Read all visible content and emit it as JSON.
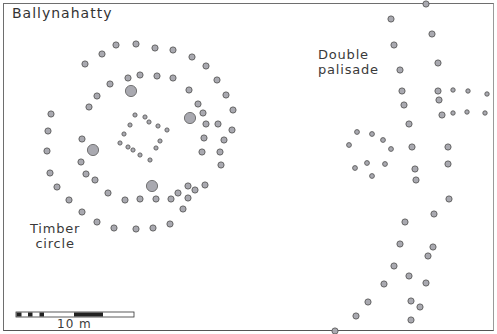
{
  "figure": {
    "title": "Ballynahatty",
    "labels": {
      "timber_circle": [
        "Timber",
        "circle"
      ],
      "double_palisade": [
        "Double",
        "palisade"
      ]
    },
    "scale_bar": {
      "label": "10 m",
      "segments_black": 5
    },
    "colors": {
      "post_fill": "#a9a9b0",
      "post_stroke": "#5a5a5a",
      "frame": "#6e6e6e",
      "text": "#3a3a3a"
    },
    "features": {
      "timber_circle_outer_ring": [
        [
          116,
          45
        ],
        [
          136,
          44
        ],
        [
          155,
          48
        ],
        [
          173,
          50
        ],
        [
          192,
          57
        ],
        [
          206,
          66
        ],
        [
          217,
          80
        ],
        [
          226,
          95
        ],
        [
          233,
          110
        ],
        [
          232,
          130
        ],
        [
          224,
          140
        ],
        [
          220,
          152
        ],
        [
          221,
          165
        ],
        [
          205,
          185
        ],
        [
          195,
          190
        ],
        [
          188,
          198
        ],
        [
          183,
          209
        ],
        [
          170,
          224
        ],
        [
          153,
          228
        ],
        [
          136,
          229
        ],
        [
          114,
          228
        ],
        [
          97,
          222
        ],
        [
          82,
          212
        ],
        [
          69,
          200
        ],
        [
          57,
          187
        ],
        [
          50,
          173
        ],
        [
          47,
          151
        ],
        [
          48,
          131
        ],
        [
          51,
          114
        ],
        [
          85,
          64
        ],
        [
          102,
          54
        ]
      ],
      "timber_circle_middle_ring": [
        [
          110,
          84
        ],
        [
          128,
          78
        ],
        [
          140,
          75
        ],
        [
          157,
          76
        ],
        [
          173,
          78
        ],
        [
          189,
          90
        ],
        [
          198,
          104
        ],
        [
          203,
          113
        ],
        [
          206,
          124
        ],
        [
          218,
          124
        ],
        [
          204,
          138
        ],
        [
          202,
          152
        ],
        [
          188,
          186
        ],
        [
          178,
          193
        ],
        [
          171,
          199
        ],
        [
          156,
          199
        ],
        [
          140,
          199
        ],
        [
          125,
          200
        ],
        [
          108,
          193
        ],
        [
          95,
          180
        ],
        [
          86,
          174
        ],
        [
          81,
          162
        ],
        [
          82,
          139
        ],
        [
          89,
          107
        ],
        [
          97,
          96
        ]
      ],
      "timber_circle_large_posts": [
        [
          131,
          91
        ],
        [
          190,
          118
        ],
        [
          93,
          150
        ],
        [
          152,
          186
        ]
      ],
      "timber_circle_inner_square": [
        [
          135,
          115
        ],
        [
          145,
          117
        ],
        [
          149,
          122
        ],
        [
          158,
          126
        ],
        [
          167,
          130
        ],
        [
          130,
          125
        ],
        [
          124,
          134
        ],
        [
          120,
          143
        ],
        [
          128,
          147
        ],
        [
          133,
          150
        ],
        [
          140,
          155
        ],
        [
          150,
          160
        ],
        [
          160,
          141
        ],
        [
          156,
          148
        ]
      ],
      "palisade_outer": [
        [
          426,
          4
        ],
        [
          391,
          19
        ],
        [
          432,
          34
        ],
        [
          394,
          45
        ],
        [
          438,
          63
        ],
        [
          400,
          70
        ],
        [
          402,
          91
        ],
        [
          404,
          105
        ],
        [
          409,
          124
        ],
        [
          412,
          147
        ],
        [
          415,
          169
        ],
        [
          416,
          180
        ],
        [
          405,
          222
        ],
        [
          400,
          244
        ],
        [
          394,
          266
        ],
        [
          384,
          284
        ],
        [
          368,
          302
        ],
        [
          356,
          316
        ],
        [
          335,
          331
        ]
      ],
      "palisade_inner": [
        [
          438,
          91
        ],
        [
          439,
          100
        ],
        [
          442,
          115
        ],
        [
          448,
          147
        ],
        [
          448,
          164
        ],
        [
          449,
          199
        ],
        [
          434,
          214
        ],
        [
          433,
          247
        ],
        [
          428,
          256
        ],
        [
          426,
          283
        ],
        [
          420,
          307
        ],
        [
          411,
          320
        ],
        [
          411,
          301
        ],
        [
          409,
          276
        ]
      ],
      "palisade_annex_small": [
        [
          453,
          90
        ],
        [
          468,
          91
        ],
        [
          487,
          94
        ],
        [
          453,
          113
        ],
        [
          467,
          112
        ],
        [
          485,
          113
        ]
      ],
      "west_cluster": [
        [
          357,
          132
        ],
        [
          372,
          134
        ],
        [
          383,
          140
        ],
        [
          391,
          149
        ],
        [
          349,
          145
        ],
        [
          385,
          164
        ],
        [
          355,
          168
        ],
        [
          372,
          176
        ],
        [
          367,
          163
        ]
      ]
    }
  }
}
